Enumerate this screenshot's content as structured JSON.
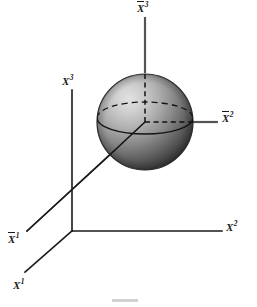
{
  "figure": {
    "background_color": "#ffffff",
    "line_color": "#1a1a1a",
    "sphere": {
      "center_x": 145,
      "center_y": 122,
      "radius": 48,
      "highlight_color": "#d8d8d8",
      "midtone_color": "#8f8f8f",
      "shadow_color": "#3a3a3a",
      "outline_color": "#2b2b2b"
    },
    "origin_unbarred": {
      "x": 72,
      "y": 231
    },
    "origin_barred": {
      "x": 145,
      "y": 122
    }
  },
  "labels": {
    "x1": {
      "base": "X",
      "sup": "1",
      "barred": false,
      "x": 14,
      "y": 281
    },
    "x2": {
      "base": "X",
      "sup": "2",
      "barred": false,
      "x": 228,
      "y": 222
    },
    "x3": {
      "base": "X",
      "sup": "3",
      "barred": false,
      "x": 63,
      "y": 78
    },
    "x1bar": {
      "base": "X",
      "sup": "1",
      "barred": true,
      "x": 9,
      "y": 237
    },
    "x2bar": {
      "base": "X",
      "sup": "2",
      "barred": true,
      "x": 224,
      "y": 113
    },
    "x3bar": {
      "base": "X",
      "sup": "3",
      "barred": true,
      "x": 137,
      "y": 3
    }
  },
  "axes": {
    "unbarred": [
      {
        "name": "x3-axis",
        "kind": "solid",
        "from": [
          72,
          231
        ],
        "to": [
          72,
          90
        ]
      },
      {
        "name": "x2-axis",
        "kind": "solid",
        "from": [
          72,
          231
        ],
        "to": [
          222,
          231
        ]
      },
      {
        "name": "x1-axis",
        "kind": "solid",
        "from": [
          72,
          231
        ],
        "to": [
          25,
          272
        ]
      }
    ],
    "barred": [
      {
        "name": "x3bar-axis",
        "kind": "solid-outside",
        "from": [
          145,
          122
        ],
        "to": [
          145,
          17
        ]
      },
      {
        "name": "x2bar-axis",
        "kind": "solid-outside",
        "from": [
          145,
          122
        ],
        "to": [
          218,
          122
        ]
      },
      {
        "name": "x1bar-axis",
        "kind": "solid",
        "from": [
          145,
          122
        ],
        "to": [
          27,
          231
        ]
      }
    ]
  },
  "caption": {
    "text": "",
    "visible": false
  }
}
